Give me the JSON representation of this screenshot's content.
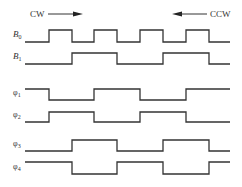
{
  "diagram": {
    "direction_labels": {
      "left": "CW",
      "right": "CCW"
    },
    "x_start": 25,
    "x_end": 230,
    "transitions": [
      49,
      72,
      94,
      117,
      140,
      163,
      186,
      209
    ],
    "signals": [
      {
        "name": "B",
        "sub": "0",
        "high_y": 30,
        "low_y": 42,
        "levels": [
          0,
          1,
          0,
          1,
          0,
          1,
          0,
          1,
          0
        ]
      },
      {
        "name": "B",
        "sub": "1",
        "high_y": 53,
        "low_y": 64,
        "levels": [
          0,
          0,
          1,
          1,
          0,
          0,
          1,
          1,
          0
        ]
      },
      {
        "name": "φ",
        "sub": "1",
        "high_y": 89,
        "low_y": 100,
        "levels": [
          1,
          0,
          0,
          1,
          1,
          0,
          0,
          1,
          1
        ]
      },
      {
        "name": "φ",
        "sub": "2",
        "high_y": 112,
        "low_y": 122,
        "levels": [
          0,
          1,
          1,
          0,
          0,
          1,
          1,
          0,
          0
        ]
      },
      {
        "name": "φ",
        "sub": "3",
        "high_y": 140,
        "low_y": 151,
        "levels": [
          0,
          0,
          1,
          1,
          0,
          0,
          1,
          1,
          0
        ]
      },
      {
        "name": "φ",
        "sub": "4",
        "high_y": 162,
        "low_y": 174,
        "levels": [
          1,
          1,
          0,
          0,
          1,
          1,
          0,
          0,
          1
        ]
      }
    ],
    "line_color": "#333333"
  }
}
